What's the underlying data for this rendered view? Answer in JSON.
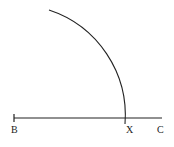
{
  "diagram": {
    "type": "geometric-construction",
    "stroke_color": "#222222",
    "background": "#ffffff",
    "segment": {
      "from": "B",
      "to": "C"
    },
    "arc": {
      "center": "B",
      "intersects_segment_at": "X"
    },
    "points": [
      {
        "label": "B"
      },
      {
        "label": "X"
      },
      {
        "label": "C"
      }
    ]
  }
}
